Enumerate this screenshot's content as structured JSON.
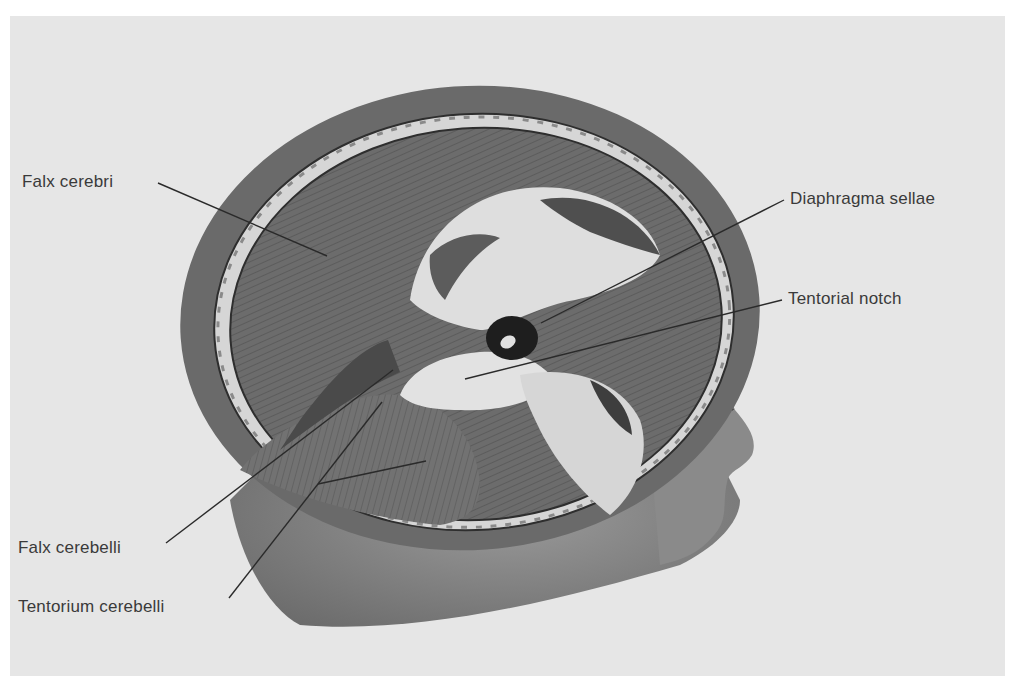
{
  "figure": {
    "colors": {
      "background": "#ffffff",
      "plate": "#e6e6e6",
      "scalp": "#6e6e6e",
      "skull_bone": "#d9d9d9",
      "dura_dark": "#5a5a5a",
      "dura_mid": "#7c7c7c",
      "opening_light": "#dcdcdc",
      "skin": "#8c8c8c",
      "label_text": "#3a3a3a",
      "leader_line": "#2a2a2a"
    },
    "labels": [
      {
        "id": "falx-cerebri",
        "text": "Falx cerebri",
        "x": 22,
        "y": 172,
        "line": {
          "x1": 158,
          "y1": 183,
          "x2": 327,
          "y2": 256
        }
      },
      {
        "id": "diaphragma-sellae",
        "text": "Diaphragma sellae",
        "x": 790,
        "y": 189,
        "line": {
          "x1": 784,
          "y1": 200,
          "x2": 541,
          "y2": 323
        }
      },
      {
        "id": "tentorial-notch",
        "text": "Tentorial notch",
        "x": 788,
        "y": 289,
        "line": {
          "x1": 782,
          "y1": 300,
          "x2": 465,
          "y2": 379
        }
      },
      {
        "id": "falx-cerebelli",
        "text": "Falx cerebelli",
        "x": 18,
        "y": 538,
        "line": {
          "x1": 166,
          "y1": 543,
          "x2": 393,
          "y2": 370
        }
      },
      {
        "id": "tentorium-cerebelli",
        "text": "Tentorium cerebelli",
        "x": 18,
        "y": 597,
        "line": {
          "x1": 229,
          "y1": 598,
          "x2": 382,
          "y2": 402
        },
        "branch": {
          "x1": 318,
          "y1": 484,
          "x2": 426,
          "y2": 461
        }
      }
    ]
  }
}
